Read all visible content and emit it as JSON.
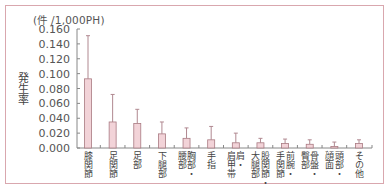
{
  "chart_data": {
    "type": "bar",
    "title": "",
    "unit_label": "(件 /1,000PH)",
    "ylabel": "発生率",
    "xlabel": "",
    "ylim": [
      0,
      0.16
    ],
    "yticks": [
      "0.000",
      "0.020",
      "0.040",
      "0.060",
      "0.080",
      "0.100",
      "0.120",
      "0.140",
      "0.160"
    ],
    "grid": false,
    "legend": null,
    "categories": [
      "膝関節",
      "足関節",
      "足部",
      "下腿部",
      "胸部・腰部",
      "手指",
      "肩・肩甲帯",
      "股関節・大腿部",
      "前腕・手関節",
      "骨盤・臀部",
      "頭部・顔面",
      "その他"
    ],
    "category_lines": [
      [
        "膝関節"
      ],
      [
        "足関節"
      ],
      [
        "足部"
      ],
      [
        "下腿部"
      ],
      [
        "胸部・",
        "腰部"
      ],
      [
        "手指"
      ],
      [
        "肩・",
        "肩甲帯"
      ],
      [
        "股関節・",
        "大腿部"
      ],
      [
        "前腕・",
        "手関節"
      ],
      [
        "骨盤・",
        "臀部"
      ],
      [
        "頭部・",
        "顔面"
      ],
      [
        "その他"
      ]
    ],
    "values": [
      0.093,
      0.035,
      0.033,
      0.019,
      0.013,
      0.011,
      0.007,
      0.007,
      0.006,
      0.005,
      0.002,
      0.006
    ],
    "error_upper": [
      0.151,
      0.072,
      0.052,
      0.035,
      0.027,
      0.029,
      0.02,
      0.013,
      0.012,
      0.011,
      0.008,
      0.011
    ]
  },
  "colors": {
    "bar_fill": "#f2d3d8",
    "bar_stroke": "#a97a82",
    "error_bar": "#b08890",
    "axis": "#888888",
    "frame": "#d9a7ae"
  }
}
